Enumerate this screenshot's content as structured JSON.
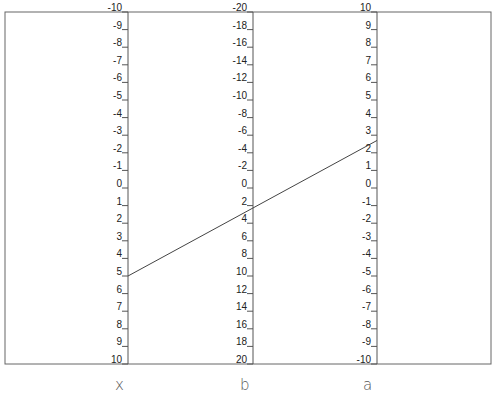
{
  "chart_data": {
    "type": "nomogram",
    "title": "",
    "axes": [
      {
        "name": "x",
        "min": -10,
        "max": 10,
        "step": 1,
        "direction": "top-to-bottom",
        "ticks": [
          "-10",
          "-9",
          "-8",
          "-7",
          "-6",
          "-5",
          "-4",
          "-3",
          "-2",
          "-1",
          "0",
          "1",
          "2",
          "3",
          "4",
          "5",
          "6",
          "7",
          "8",
          "9",
          "10"
        ]
      },
      {
        "name": "b",
        "min": -20,
        "max": 20,
        "step": 2,
        "direction": "top-to-bottom",
        "ticks": [
          "-20",
          "-18",
          "-16",
          "-14",
          "-12",
          "-10",
          "-8",
          "-6",
          "-4",
          "-2",
          "0",
          "2",
          "4",
          "6",
          "8",
          "10",
          "12",
          "14",
          "16",
          "18",
          "20"
        ]
      },
      {
        "name": "a",
        "min": 10,
        "max": -10,
        "step": -1,
        "direction": "top-to-bottom",
        "ticks": [
          "10",
          "9",
          "8",
          "7",
          "6",
          "5",
          "4",
          "3",
          "2",
          "1",
          "0",
          "-1",
          "-2",
          "-3",
          "-4",
          "-5",
          "-6",
          "-7",
          "-8",
          "-9",
          "-10"
        ]
      }
    ],
    "isopleth": {
      "x": 5,
      "b": 2.5,
      "a": 2.7
    },
    "colors": {
      "axis": "#555555",
      "line": "#444444",
      "text": "#222222"
    }
  },
  "labels": {
    "axis_x": "x",
    "axis_b": "b",
    "axis_a": "a"
  }
}
